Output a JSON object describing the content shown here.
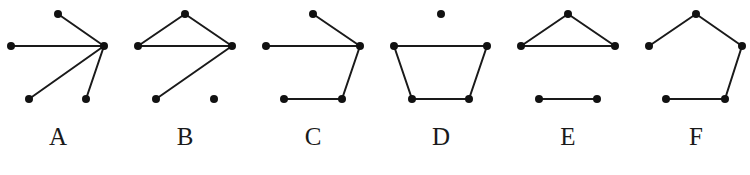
{
  "diagram": {
    "node_color": "#111111",
    "edge_color": "#1a1a1a",
    "panels": [
      {
        "label": "A",
        "label_pos": [
          58,
          145
        ],
        "nodes": [
          [
            58,
            14
          ],
          [
            11,
            46
          ],
          [
            104,
            46
          ],
          [
            29,
            99
          ],
          [
            86,
            99
          ]
        ],
        "edges": [
          [
            0,
            2
          ],
          [
            1,
            2
          ],
          [
            3,
            2
          ],
          [
            4,
            2
          ]
        ]
      },
      {
        "label": "B",
        "label_pos": [
          185,
          145
        ],
        "nodes": [
          [
            185,
            14
          ],
          [
            138,
            46
          ],
          [
            232,
            46
          ],
          [
            156,
            99
          ],
          [
            214,
            99
          ]
        ],
        "edges": [
          [
            0,
            1
          ],
          [
            0,
            2
          ],
          [
            1,
            2
          ],
          [
            2,
            3
          ]
        ]
      },
      {
        "label": "C",
        "label_pos": [
          313,
          145
        ],
        "nodes": [
          [
            313,
            14
          ],
          [
            266,
            46
          ],
          [
            360,
            46
          ],
          [
            284,
            99
          ],
          [
            342,
            99
          ]
        ],
        "edges": [
          [
            0,
            2
          ],
          [
            1,
            2
          ],
          [
            2,
            4
          ],
          [
            3,
            4
          ]
        ]
      },
      {
        "label": "D",
        "label_pos": [
          441,
          145
        ],
        "nodes": [
          [
            441,
            14
          ],
          [
            394,
            46
          ],
          [
            487,
            46
          ],
          [
            412,
            99
          ],
          [
            469,
            99
          ]
        ],
        "edges": [
          [
            1,
            2
          ],
          [
            1,
            3
          ],
          [
            2,
            4
          ],
          [
            3,
            4
          ]
        ]
      },
      {
        "label": "E",
        "label_pos": [
          568,
          145
        ],
        "nodes": [
          [
            568,
            14
          ],
          [
            521,
            46
          ],
          [
            615,
            46
          ],
          [
            539,
            99
          ],
          [
            597,
            99
          ]
        ],
        "edges": [
          [
            0,
            1
          ],
          [
            0,
            2
          ],
          [
            1,
            2
          ],
          [
            3,
            4
          ]
        ]
      },
      {
        "label": "F",
        "label_pos": [
          696,
          145
        ],
        "nodes": [
          [
            696,
            14
          ],
          [
            649,
            46
          ],
          [
            742,
            46
          ],
          [
            666,
            99
          ],
          [
            725,
            99
          ]
        ],
        "edges": [
          [
            0,
            1
          ],
          [
            0,
            2
          ],
          [
            2,
            4
          ],
          [
            3,
            4
          ]
        ]
      }
    ]
  }
}
